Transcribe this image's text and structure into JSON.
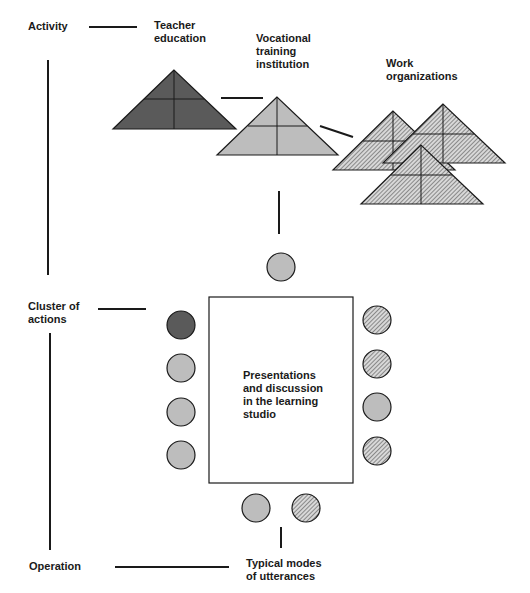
{
  "levels": {
    "activity": "Activity",
    "cluster_line1": "Cluster of",
    "cluster_line2": "actions",
    "operation": "Operation"
  },
  "nodes": {
    "teacher_line1": "Teacher",
    "teacher_line2": "education",
    "vocational_line1": "Vocational",
    "vocational_line2": "training",
    "vocational_line3": "institution",
    "work_line1": "Work",
    "work_line2": "organizations"
  },
  "studio": {
    "line1": "Presentations",
    "line2": "and discussion",
    "line3": "in the learning",
    "line4": "studio"
  },
  "utterances": {
    "line1": "Typical modes",
    "line2": "of utterances"
  },
  "colors": {
    "teacher_fill": "#5a5a5a",
    "vocational_fill": "#bdbdbd",
    "work_fill": "hatched",
    "stroke": "#1a1a1a"
  },
  "seats": {
    "top": [
      "light"
    ],
    "left": [
      "dark",
      "light",
      "light",
      "light"
    ],
    "right": [
      "hatched",
      "hatched",
      "light",
      "hatched"
    ],
    "bottom": [
      "light",
      "hatched"
    ]
  }
}
